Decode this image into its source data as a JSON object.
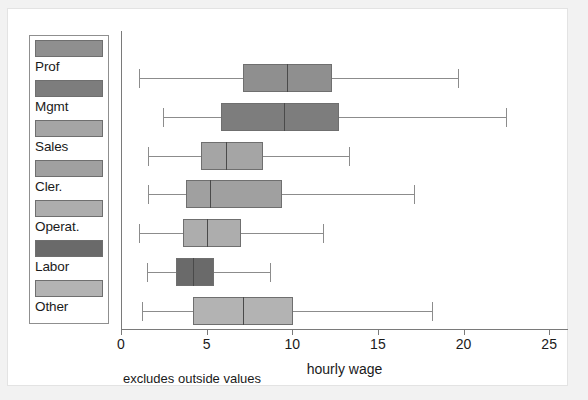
{
  "chart_data": {
    "type": "box",
    "title": "",
    "xlabel": "hourly wage",
    "ylabel": "",
    "footnote": "excludes outside values",
    "xlim": [
      0,
      26.1
    ],
    "xticks": [
      0,
      5,
      10,
      15,
      20,
      25
    ],
    "xticklabels": [
      "0",
      "5",
      "10",
      "15",
      "20",
      "25"
    ],
    "grid": false,
    "legend_position": "left-outside",
    "orientation": "horizontal",
    "categories": [
      "Prof",
      "Mgmt",
      "Sales",
      "Cler.",
      "Operat.",
      "Labor",
      "Other"
    ],
    "boxes": [
      {
        "label": "Prof",
        "color": "#8f8f8f",
        "whisker_low": 1.05,
        "q1": 7.1,
        "median": 9.7,
        "q3": 12.3,
        "whisker_high": 19.7
      },
      {
        "label": "Mgmt",
        "color": "#7d7d7d",
        "whisker_low": 2.45,
        "q1": 5.85,
        "median": 9.5,
        "q3": 12.7,
        "whisker_high": 22.5
      },
      {
        "label": "Sales",
        "color": "#a5a5a5",
        "whisker_low": 1.6,
        "q1": 4.7,
        "median": 6.15,
        "q3": 8.3,
        "whisker_high": 13.3
      },
      {
        "label": "Cler.",
        "color": "#a0a0a0",
        "whisker_low": 1.6,
        "q1": 3.8,
        "median": 5.2,
        "q3": 9.4,
        "whisker_high": 17.1
      },
      {
        "label": "Operat.",
        "color": "#adadad",
        "whisker_low": 1.05,
        "q1": 3.6,
        "median": 5.05,
        "q3": 7.0,
        "whisker_high": 11.8
      },
      {
        "label": "Labor",
        "color": "#6a6a6a",
        "whisker_low": 1.5,
        "q1": 3.2,
        "median": 4.2,
        "q3": 5.45,
        "whisker_high": 8.7
      },
      {
        "label": "Other",
        "color": "#b3b3b3",
        "whisker_low": 1.2,
        "q1": 4.2,
        "median": 7.1,
        "q3": 10.05,
        "whisker_high": 18.15
      }
    ]
  },
  "legend": {
    "items": [
      {
        "label": "Prof",
        "color": "#8f8f8f"
      },
      {
        "label": "Mgmt",
        "color": "#7d7d7d"
      },
      {
        "label": "Sales",
        "color": "#a5a5a5"
      },
      {
        "label": "Cler.",
        "color": "#a0a0a0"
      },
      {
        "label": "Operat.",
        "color": "#adadad"
      },
      {
        "label": "Labor",
        "color": "#6a6a6a"
      },
      {
        "label": "Other",
        "color": "#b3b3b3"
      }
    ]
  },
  "colors": {
    "page_background": "#f2f2f2",
    "canvas_background": "#ffffff",
    "axis": "#7a7a7a",
    "text": "#1a1a1a",
    "box_outline": "#6f6f6f"
  }
}
